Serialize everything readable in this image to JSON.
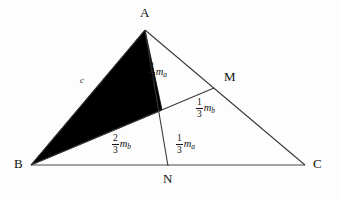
{
  "figure": {
    "type": "geometry-diagram",
    "background_color": "#fdfdfd",
    "stroke_color": "#3a3a3a",
    "shade_color": "#000000"
  },
  "points": {
    "A": {
      "label": "A",
      "x": 145,
      "y": 30,
      "label_x": 140,
      "label_y": 6
    },
    "B": {
      "label": "B",
      "x": 31,
      "y": 165,
      "label_x": 14,
      "label_y": 157
    },
    "C": {
      "label": "C",
      "x": 305,
      "y": 165,
      "label_x": 313,
      "label_y": 157
    },
    "M": {
      "label": "M",
      "x": 214,
      "y": 88,
      "label_x": 224,
      "label_y": 70
    },
    "N": {
      "label": "N",
      "x": 168,
      "y": 166,
      "label_x": 163,
      "label_y": 172
    },
    "G": {
      "label": "",
      "x": 162,
      "y": 110
    }
  },
  "segments": [
    {
      "name": "side-AB",
      "from": "A",
      "to": "B"
    },
    {
      "name": "side-BC",
      "from": "B",
      "to": "C"
    },
    {
      "name": "side-AC",
      "from": "A",
      "to": "C"
    },
    {
      "name": "median-AN",
      "from": "A",
      "to": "N"
    },
    {
      "name": "median-BM",
      "from": "B",
      "to": "M"
    }
  ],
  "shaded_region": {
    "name": "triangle-ABG",
    "vertices": [
      "A",
      "B",
      "G"
    ],
    "fill": "#000000"
  },
  "labels": {
    "side_c": {
      "text": "c",
      "x": 80,
      "y": 76
    },
    "two_thirds_ma": {
      "numerator": "2",
      "denominator": "3",
      "symbol": "m",
      "subscript": "a",
      "x": 148,
      "y": 62
    },
    "one_third_mb": {
      "numerator": "1",
      "denominator": "3",
      "symbol": "m",
      "subscript": "b",
      "x": 196,
      "y": 98
    },
    "two_thirds_mb": {
      "numerator": "2",
      "denominator": "3",
      "symbol": "m",
      "subscript": "b",
      "x": 112,
      "y": 134
    },
    "one_third_ma": {
      "numerator": "1",
      "denominator": "3",
      "symbol": "m",
      "subscript": "a",
      "x": 176,
      "y": 134
    }
  }
}
